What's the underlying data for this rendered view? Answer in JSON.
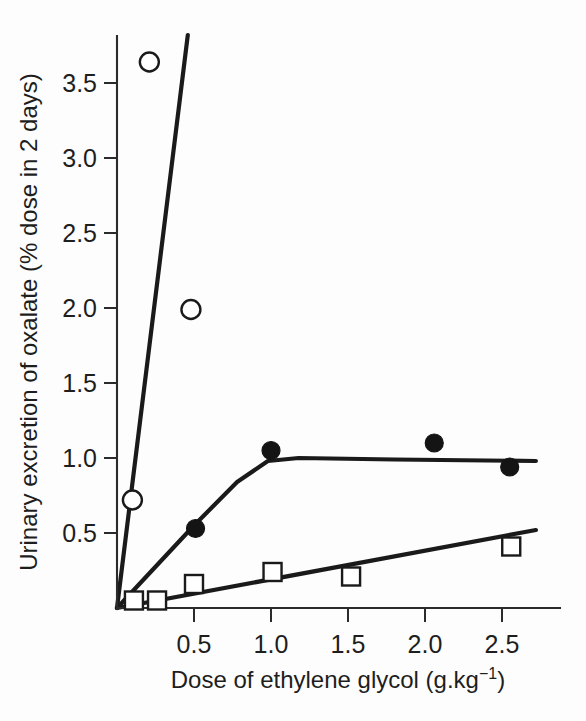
{
  "chart_data": {
    "type": "scatter",
    "title": "",
    "subtitle": "",
    "xlabel": "Dose of ethylene glycol (g.kg",
    "xlabel_superscript": "−1",
    "xlabel_suffix": ")",
    "xlabel_full": "Dose of ethylene glycol (g.kg−1)",
    "ylabel": "Urinary excretion of oxalate (% dose in 2 days)",
    "xlim": [
      0.0,
      2.75
    ],
    "ylim": [
      0.0,
      3.82
    ],
    "grid": false,
    "legend": "none",
    "xticks": [
      0.5,
      1.0,
      1.5,
      2.0,
      2.5
    ],
    "xticklabels": [
      "0.5",
      "1.0",
      "1.5",
      "2.0",
      "2.5"
    ],
    "yticks": [
      0.5,
      1.0,
      1.5,
      2.0,
      2.5,
      3.0,
      3.5
    ],
    "yticklabels": [
      "0.5",
      "1.0",
      "1.5",
      "2.0",
      "2.5",
      "3.0",
      "3.5"
    ],
    "series": [
      {
        "name": "open-circles",
        "marker": "open-circle",
        "points": [
          {
            "x": 0.1,
            "y": 0.72
          },
          {
            "x": 0.21,
            "y": 3.64
          },
          {
            "x": 0.48,
            "y": 1.99
          }
        ],
        "fit_line": [
          {
            "x": 0.0,
            "y": 0.0
          },
          {
            "x": 0.46,
            "y": 3.82
          }
        ]
      },
      {
        "name": "filled-circles",
        "marker": "filled-circle",
        "points": [
          {
            "x": 0.51,
            "y": 0.53
          },
          {
            "x": 1.0,
            "y": 1.05
          },
          {
            "x": 2.06,
            "y": 1.1
          },
          {
            "x": 2.55,
            "y": 0.94
          }
        ],
        "fit_line": [
          {
            "x": 0.0,
            "y": 0.0
          },
          {
            "x": 0.5,
            "y": 0.55
          },
          {
            "x": 0.78,
            "y": 0.84
          },
          {
            "x": 0.98,
            "y": 0.98
          },
          {
            "x": 1.18,
            "y": 1.0
          },
          {
            "x": 1.8,
            "y": 0.99
          },
          {
            "x": 2.72,
            "y": 0.98
          }
        ]
      },
      {
        "name": "open-squares",
        "marker": "open-square",
        "points": [
          {
            "x": 0.11,
            "y": 0.05
          },
          {
            "x": 0.26,
            "y": 0.05
          },
          {
            "x": 0.5,
            "y": 0.16
          },
          {
            "x": 1.01,
            "y": 0.24
          },
          {
            "x": 1.52,
            "y": 0.21
          },
          {
            "x": 2.56,
            "y": 0.41
          }
        ],
        "fit_line": [
          {
            "x": 0.0,
            "y": 0.0
          },
          {
            "x": 2.72,
            "y": 0.52
          }
        ]
      }
    ]
  }
}
